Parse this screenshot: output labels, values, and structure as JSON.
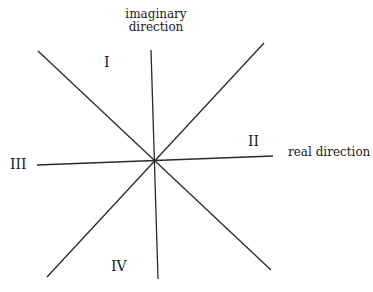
{
  "diagram": {
    "labels": {
      "imaginary_line1": "imaginary",
      "imaginary_line2": "direction",
      "real": "real direction",
      "q1": "I",
      "q2": "II",
      "q3": "III",
      "q4": "IV"
    },
    "line_color": "#2a2a2a",
    "center": [
      153,
      161
    ]
  }
}
